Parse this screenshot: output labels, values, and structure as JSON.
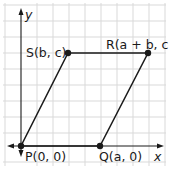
{
  "figure": {
    "type": "coordinate-plane-parallelogram",
    "axes": {
      "x_label": "x",
      "y_label": "y"
    },
    "colors": {
      "grid": "#d9d9d9",
      "line": "#1a1a1a",
      "background": "#ffffff"
    },
    "points": [
      {
        "name": "P",
        "label": "P(0, 0)"
      },
      {
        "name": "Q",
        "label": "Q(a, 0)"
      },
      {
        "name": "R",
        "label": "R(a + b, c)"
      },
      {
        "name": "S",
        "label": "S(b, c)"
      }
    ]
  }
}
